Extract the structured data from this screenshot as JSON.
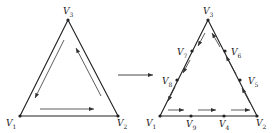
{
  "colors": {
    "stroke": "#222222",
    "arrow": "#333333",
    "background": "#ffffff"
  },
  "left_triangle": {
    "vertices": [
      {
        "id": "V1",
        "base": "V",
        "sub": "1",
        "x": 20,
        "y": 116,
        "label_x": 6,
        "label_y": 119
      },
      {
        "id": "V2",
        "base": "V",
        "sub": "2",
        "x": 118,
        "y": 116,
        "label_x": 117,
        "label_y": 119
      },
      {
        "id": "V3",
        "base": "V",
        "sub": "3",
        "x": 68,
        "y": 20,
        "label_x": 63,
        "label_y": 7
      }
    ],
    "arrows": [
      {
        "from": [
          40,
          109
        ],
        "to": [
          94,
          109
        ],
        "direction": "V1-to-V2"
      },
      {
        "from": [
          101,
          96
        ],
        "to": [
          76,
          48
        ],
        "direction": "V2-to-V3"
      },
      {
        "from": [
          64,
          40
        ],
        "to": [
          35,
          98
        ],
        "direction": "V3-to-V1"
      }
    ]
  },
  "transform_arrow": {
    "from": [
      118,
      75
    ],
    "to": [
      153,
      75
    ]
  },
  "right_triangle": {
    "vertices": [
      {
        "id": "V1",
        "base": "V",
        "sub": "1",
        "x": 160,
        "y": 116,
        "label_x": 146,
        "label_y": 119
      },
      {
        "id": "V2",
        "base": "V",
        "sub": "2",
        "x": 257,
        "y": 116,
        "label_x": 256,
        "label_y": 119
      },
      {
        "id": "V3",
        "base": "V",
        "sub": "3",
        "x": 208,
        "y": 20,
        "label_x": 203,
        "label_y": 7
      },
      {
        "id": "V4",
        "base": "V",
        "sub": "4",
        "x": 224,
        "y": 116,
        "label_x": 219,
        "label_y": 120
      },
      {
        "id": "V5",
        "base": "V",
        "sub": "5",
        "x": 240,
        "y": 80,
        "label_x": 248,
        "label_y": 77
      },
      {
        "id": "V6",
        "base": "V",
        "sub": "6",
        "x": 225,
        "y": 51,
        "label_x": 231,
        "label_y": 48
      },
      {
        "id": "V7",
        "base": "V",
        "sub": "7",
        "x": 192,
        "y": 51,
        "label_x": 177,
        "label_y": 48
      },
      {
        "id": "V8",
        "base": "V",
        "sub": "8",
        "x": 177,
        "y": 80,
        "label_x": 162,
        "label_y": 77
      },
      {
        "id": "V9",
        "base": "V",
        "sub": "9",
        "x": 191,
        "y": 116,
        "label_x": 186,
        "label_y": 120
      }
    ],
    "arrows": [
      {
        "from": [
          168,
          110
        ],
        "to": [
          184,
          110
        ]
      },
      {
        "from": [
          198,
          110
        ],
        "to": [
          216,
          110
        ]
      },
      {
        "from": [
          231,
          110
        ],
        "to": [
          250,
          110
        ]
      },
      {
        "from": [
          250,
          103
        ],
        "to": [
          242,
          88
        ]
      },
      {
        "from": [
          236,
          74
        ],
        "to": [
          226,
          56
        ]
      },
      {
        "from": [
          220,
          47
        ],
        "to": [
          212,
          33
        ]
      },
      {
        "from": [
          205,
          33
        ],
        "to": [
          198,
          46
        ]
      },
      {
        "from": [
          190,
          60
        ],
        "to": [
          183,
          73
        ]
      },
      {
        "from": [
          175,
          87
        ],
        "to": [
          168,
          101
        ]
      }
    ]
  }
}
